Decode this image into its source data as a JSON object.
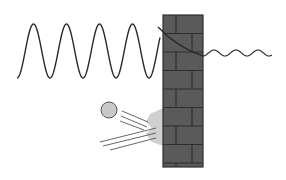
{
  "diagram": {
    "title": "",
    "colors": {
      "background": "#ffffff",
      "wall_fill": "#5a5a5a",
      "mortar": "#2e2e2e",
      "wave_stroke": "#2a2a2a",
      "ball_fill": "#c8c8c8",
      "ball_stroke": "#555555",
      "impact_fill": "#d0d0d0",
      "motion_lines": "#555555"
    },
    "wall": {
      "x": 163,
      "y": 15,
      "width": 40,
      "height": 152,
      "row_height": 18.5,
      "rows": [
        {
          "y": 15,
          "joints": [
            176
          ]
        },
        {
          "y": 33.5,
          "joints": [
            192
          ]
        },
        {
          "y": 52,
          "joints": [
            176
          ]
        },
        {
          "y": 70.5,
          "joints": [
            192
          ]
        },
        {
          "y": 89,
          "joints": [
            176
          ]
        },
        {
          "y": 107.5,
          "joints": [
            192
          ]
        },
        {
          "y": 126,
          "joints": [
            176
          ]
        },
        {
          "y": 144.5,
          "joints": [
            192
          ]
        },
        {
          "y": 163,
          "joints": [
            176
          ]
        }
      ]
    },
    "incident_wave": {
      "x_start": 17,
      "x_end": 160,
      "center_y": 51,
      "amplitude": 27,
      "wavelength": 33
    },
    "decay_curve": {
      "from": [
        158,
        27
      ],
      "ctrl": [
        178,
        48
      ],
      "to": [
        203,
        56
      ]
    },
    "transmitted_wave": {
      "x_start": 203,
      "x_end": 272,
      "center_y": 53,
      "amplitude": 3,
      "wavelength": 22
    },
    "ball": {
      "cx": 109,
      "cy": 110,
      "r": 8
    },
    "impact_splash": {
      "points": "163,108 150,114 146,122 152,128 146,134 152,142 163,146"
    },
    "motion_lines": [
      {
        "x1": 122,
        "y1": 111,
        "x2": 148,
        "y2": 122
      },
      {
        "x1": 121,
        "y1": 116,
        "x2": 147,
        "y2": 127
      },
      {
        "x1": 120,
        "y1": 121,
        "x2": 144,
        "y2": 130
      },
      {
        "x1": 100,
        "y1": 142,
        "x2": 156,
        "y2": 128
      },
      {
        "x1": 103,
        "y1": 146,
        "x2": 156,
        "y2": 133
      },
      {
        "x1": 110,
        "y1": 150,
        "x2": 156,
        "y2": 138
      }
    ]
  }
}
